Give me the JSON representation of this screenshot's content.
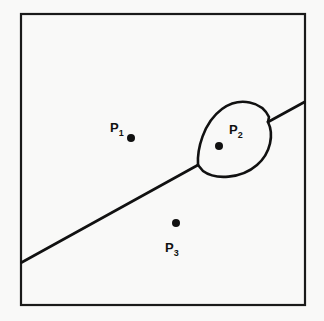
{
  "figure": {
    "title": "",
    "caption": "",
    "background_color": "#f9f9f8",
    "frame": {
      "name": "bounding-box",
      "stroke_color": "#1a1a1a",
      "stroke_width": 2.2,
      "x": 21,
      "y": 14,
      "width": 284,
      "height": 291
    },
    "curve": {
      "name": "bisector-boundary",
      "description": "diagonal boundary curve with oval bulge around P2",
      "stroke_color": "#111111",
      "stroke_width": 2.6,
      "left_endpoint": [
        21,
        262
      ],
      "right_endpoint": [
        305,
        102
      ],
      "lower_cusp": [
        198,
        165
      ],
      "upper_cusp": [
        268,
        122
      ],
      "blob_bounds": {
        "x": 197,
        "y": 103,
        "width": 73,
        "height": 70
      }
    },
    "points": [
      {
        "id": "P1",
        "label": "P",
        "subscript": "1",
        "label_x": 110,
        "label_y": 132,
        "dot_x": 131,
        "dot_y": 138,
        "dot_radius": 4.0,
        "color": "#111111"
      },
      {
        "id": "P2",
        "label": "P",
        "subscript": "2",
        "label_x": 229,
        "label_y": 134,
        "dot_x": 219,
        "dot_y": 146,
        "dot_radius": 4.0,
        "color": "#111111"
      },
      {
        "id": "P3",
        "label": "P",
        "subscript": "3",
        "label_x": 165,
        "label_y": 252,
        "dot_x": 176,
        "dot_y": 223,
        "dot_radius": 4.0,
        "color": "#111111"
      }
    ]
  }
}
